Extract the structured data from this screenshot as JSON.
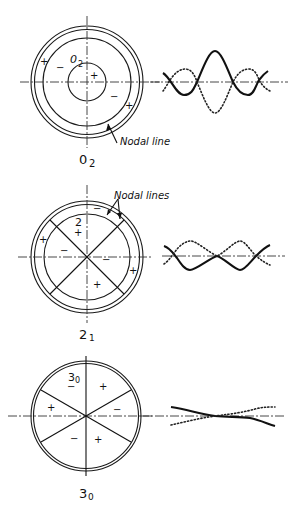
{
  "figure": {
    "modes": [
      {
        "id": "mode-0-2",
        "label_main": "0",
        "label_sub": "2",
        "inner_label_main": "0",
        "inner_label_sub": "2",
        "callout": "Nodal line",
        "signs": [
          {
            "text": "+",
            "x": 43,
            "y": 64
          },
          {
            "text": "−",
            "x": 59,
            "y": 72
          },
          {
            "text": "+",
            "x": 90,
            "y": 79
          },
          {
            "text": "−",
            "x": 110,
            "y": 100
          },
          {
            "text": "+",
            "x": 128,
            "y": 109
          }
        ]
      },
      {
        "id": "mode-2-1",
        "label_main": "2",
        "label_sub": "1",
        "inner_label": "2",
        "callout": "Nodal lines",
        "signs": [
          {
            "text": "−",
            "x": 96,
            "y": 212
          },
          {
            "text": "+",
            "x": 76,
            "y": 236
          },
          {
            "text": "+",
            "x": 40,
            "y": 243
          },
          {
            "text": "−",
            "x": 61,
            "y": 254
          },
          {
            "text": "−",
            "x": 103,
            "y": 262
          },
          {
            "text": "+",
            "x": 131,
            "y": 274
          },
          {
            "text": "+",
            "x": 95,
            "y": 288
          }
        ]
      },
      {
        "id": "mode-3-0",
        "label_main": "3",
        "label_sub": "0",
        "inner_label_main": "3",
        "inner_label_sub": "0",
        "signs": [
          {
            "text": "−",
            "x": 69,
            "y": 390
          },
          {
            "text": "+",
            "x": 101,
            "y": 389
          },
          {
            "text": "+",
            "x": 49,
            "y": 410
          },
          {
            "text": "−",
            "x": 114,
            "y": 412
          },
          {
            "text": "−",
            "x": 72,
            "y": 441
          },
          {
            "text": "+",
            "x": 96,
            "y": 442
          }
        ]
      }
    ],
    "colors": {
      "ink": "#111111",
      "background": "#ffffff"
    }
  }
}
